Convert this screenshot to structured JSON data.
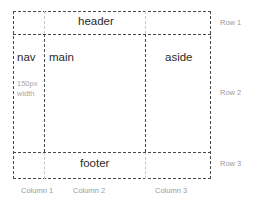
{
  "diagram": {
    "frame": {
      "border_color": "#4a4a4a",
      "faint_guide_color": "#c9c9c9",
      "background": "#ffffff"
    },
    "regions": [
      {
        "key": "header",
        "label": "header"
      },
      {
        "key": "nav",
        "label": "nav"
      },
      {
        "key": "main",
        "label": "main"
      },
      {
        "key": "aside",
        "label": "aside"
      },
      {
        "key": "footer",
        "label": "footer"
      }
    ],
    "annotations": {
      "nav_width_note": "150px width"
    },
    "row_labels": [
      {
        "key": "row-1",
        "label": "Row 1"
      },
      {
        "key": "row-2",
        "label": "Row 2"
      },
      {
        "key": "row-3",
        "label": "Row 3"
      }
    ],
    "column_labels": [
      {
        "key": "column-1",
        "label": "Column 1"
      },
      {
        "key": "column-2",
        "label": "Column 2"
      },
      {
        "key": "column-3",
        "label": "Column 3"
      }
    ],
    "colors": {
      "cell_text": "#2b2b2b",
      "annotation_text": "#a8a8a8",
      "axis_label_text": "#9a9a9a"
    }
  }
}
